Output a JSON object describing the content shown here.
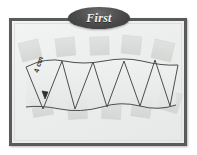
{
  "figure": {
    "name": "first-step-cone-strip-diagram",
    "panel": {
      "background_color": "#eceded",
      "border_color": "#5a5a5a"
    },
    "title_badge": {
      "label": "First",
      "shape": "oval",
      "fill_color": "#4a4a4a",
      "text_color": "#f2f2f2"
    },
    "dimension_label": {
      "text": "4 cm",
      "rotation_deg": -72
    },
    "drawing": {
      "stroke_color": "#4d4d4d",
      "tape_color": "#d6d8d6",
      "paper_fill": "#e9eaea",
      "description": "zigzag strip of alternating triangles between two arcs, held by tape pieces",
      "triangle_count_up": 5,
      "triangle_count_down": 4,
      "tape_pieces": [
        {
          "name": "tape-top-1",
          "x": 8,
          "y": 20,
          "w": 20,
          "h": 18,
          "rot": -14
        },
        {
          "name": "tape-top-2",
          "x": 44,
          "y": 16,
          "w": 19,
          "h": 17,
          "rot": -6
        },
        {
          "name": "tape-top-3",
          "x": 78,
          "y": 16,
          "w": 19,
          "h": 17,
          "rot": -3
        },
        {
          "name": "tape-top-4",
          "x": 110,
          "y": 14,
          "w": 19,
          "h": 17,
          "rot": 5
        },
        {
          "name": "tape-top-5",
          "x": 142,
          "y": 20,
          "w": 19,
          "h": 18,
          "rot": 12
        },
        {
          "name": "tape-bottom-1",
          "x": 20,
          "y": 76,
          "w": 20,
          "h": 18,
          "rot": -10
        },
        {
          "name": "tape-bottom-2",
          "x": 56,
          "y": 80,
          "w": 19,
          "h": 17,
          "rot": -3
        },
        {
          "name": "tape-bottom-3",
          "x": 90,
          "y": 80,
          "w": 19,
          "h": 17,
          "rot": 3
        },
        {
          "name": "tape-bottom-4",
          "x": 120,
          "y": 78,
          "w": 19,
          "h": 17,
          "rot": 8
        },
        {
          "name": "tape-bottom-5",
          "x": 148,
          "y": 70,
          "w": 20,
          "h": 19,
          "rot": 16
        }
      ],
      "strip": {
        "top_arc": "M 14,44 Q 48,32 84,40 Q 120,48 160,40",
        "bottom_arc": "M 14,44 Q 48,94 84,86 Q 120,78 160,86",
        "vertices_top": [
          [
            16,
            45
          ],
          [
            48,
            37
          ],
          [
            80,
            40
          ],
          [
            112,
            41
          ],
          [
            144,
            38
          ],
          [
            166,
            44
          ]
        ],
        "vertices_bottom": [
          [
            32,
            88
          ],
          [
            64,
            87
          ],
          [
            96,
            85
          ],
          [
            128,
            84
          ],
          [
            158,
            82
          ]
        ]
      }
    }
  }
}
